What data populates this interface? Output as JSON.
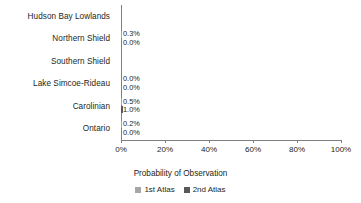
{
  "chart_data": {
    "type": "bar",
    "orientation": "horizontal",
    "title": "",
    "xlabel": "Probability of Observation",
    "ylabel": "",
    "xlim": [
      0,
      100
    ],
    "xunit": "%",
    "grid": false,
    "legend_position": "bottom",
    "categories": [
      "Hudson Bay Lowlands",
      "Northern Shield",
      "Southern Shield",
      "Lake Simcoe-Rideau",
      "Carolinian",
      "Ontario"
    ],
    "xticks": [
      0,
      20,
      40,
      60,
      80,
      100
    ],
    "xtick_labels": [
      "0%",
      "20%",
      "40%",
      "60%",
      "80%",
      "100%"
    ],
    "series": [
      {
        "name": "1st Atlas",
        "color": "#a6a6a6",
        "values": [
          null,
          0.3,
          null,
          0.0,
          0.5,
          0.2
        ],
        "labels": [
          "",
          "0.3%",
          "",
          "0.0%",
          "0.5%",
          "0.2%"
        ]
      },
      {
        "name": "2nd Atlas",
        "color": "#595959",
        "values": [
          null,
          0.0,
          null,
          0.0,
          1.0,
          0.0
        ],
        "labels": [
          "",
          "0.0%",
          "",
          "0.0%",
          "1.0%",
          "0.0%"
        ]
      }
    ]
  },
  "legend": {
    "items": [
      {
        "label": "1st Atlas",
        "color": "#a6a6a6"
      },
      {
        "label": "2nd Atlas",
        "color": "#595959"
      }
    ]
  },
  "axis": {
    "x_title": "Probability of Observation"
  }
}
